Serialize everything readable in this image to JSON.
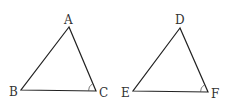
{
  "diagram": {
    "type": "geometry",
    "triangles": [
      {
        "name": "ABC",
        "vertices": {
          "A": "A",
          "B": "B",
          "C": "C"
        },
        "marked_angle": "C"
      },
      {
        "name": "DEF",
        "vertices": {
          "D": "D",
          "E": "E",
          "F": "F"
        },
        "marked_angle": "F"
      }
    ]
  }
}
